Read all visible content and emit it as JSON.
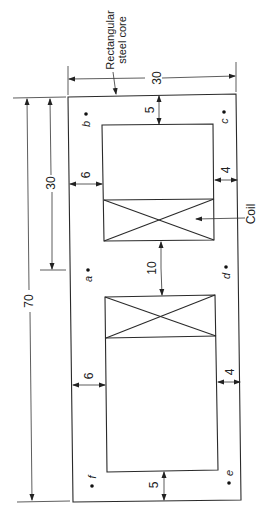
{
  "diagram": {
    "title_label": [
      "Rectangular",
      "steel core"
    ],
    "coil_label": "Coil",
    "dimensions": {
      "core_width": "30",
      "core_height": "70",
      "upper_window_span": "30",
      "top_yoke": "5",
      "bottom_yoke": "5",
      "left_leg_upper": "6",
      "left_leg_lower": "6",
      "right_leg_upper": "4",
      "right_leg_lower": "4",
      "center_limb": "10"
    },
    "points": {
      "a": "a",
      "b": "b",
      "c": "c",
      "d": "d",
      "e": "e",
      "f": "f"
    },
    "colors": {
      "line": "#2a2a2a",
      "background": "#ffffff"
    }
  }
}
